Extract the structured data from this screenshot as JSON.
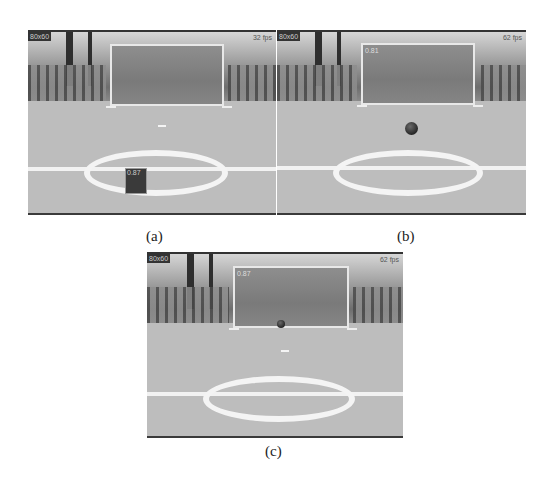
{
  "figure": {
    "panels": [
      {
        "id": "a",
        "caption": "(a)",
        "fps": "32 fps",
        "resolution": "80x60",
        "ball_state": "detected-in-box-near-center-circle",
        "box_label": "0.87"
      },
      {
        "id": "b",
        "caption": "(b)",
        "fps": "62 fps",
        "resolution": "80x60",
        "ball_state": "rolling-toward-goal",
        "goal_label": "0.81"
      },
      {
        "id": "c",
        "caption": "(c)",
        "fps": "62 fps",
        "resolution": "80x60",
        "ball_state": "at-goal-line",
        "goal_label": "0.87"
      }
    ]
  }
}
